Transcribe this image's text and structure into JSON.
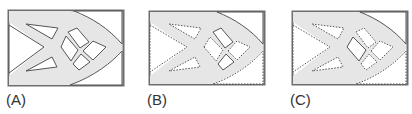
{
  "figure": {
    "colors": {
      "frame": "#6e6e6e",
      "material": "#e6e6e6",
      "void": "#ffffff",
      "outline": "#555555"
    },
    "panels": [
      {
        "id": "A",
        "label": "(A)",
        "outline_style": "solid"
      },
      {
        "id": "B",
        "label": "(B)",
        "outline_style": "dotted"
      },
      {
        "id": "C",
        "label": "(C)",
        "outline_style": "dotted"
      }
    ]
  }
}
